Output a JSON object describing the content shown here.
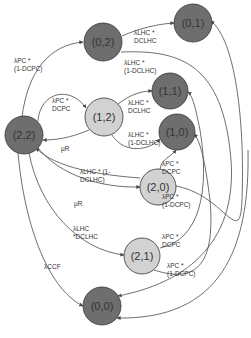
{
  "diagram": {
    "type": "state-transition-diagram",
    "colors": {
      "dark_node": "#6e6e6e",
      "light_node": "#d2d2d2",
      "edge": "#4a4a4a",
      "text": "#333333"
    },
    "nodes": [
      {
        "id": "n22",
        "label": "(2,2)",
        "shade": "dark"
      },
      {
        "id": "n02",
        "label": "(0,2)",
        "shade": "dark"
      },
      {
        "id": "n01",
        "label": "(0,1)",
        "shade": "dark"
      },
      {
        "id": "n12",
        "label": "(1,2)",
        "shade": "light"
      },
      {
        "id": "n11",
        "label": "(1,1)",
        "shade": "dark"
      },
      {
        "id": "n10",
        "label": "(1,0)",
        "shade": "dark"
      },
      {
        "id": "n20",
        "label": "(2,0)",
        "shade": "light"
      },
      {
        "id": "n21",
        "label": "(2,1)",
        "shade": "light"
      },
      {
        "id": "n00",
        "label": "(0,0)",
        "shade": "dark"
      }
    ],
    "edge_labels": {
      "e22_02": "λPC *\n(1-DCPC)",
      "e22_12": "λPC *\nDCPC",
      "e02_01": "λLHC *\nDCLHC",
      "e02_far": "λLHC *\n(1-DCLHC)",
      "e12_11": "λLHC *\nDCLHC",
      "e12_10": "λLHC *\n(1-DCLHC)",
      "e12_22": "μR",
      "e22_20": "λLHC * (1-\nDCLHC)",
      "e20_10": "λPC *\nDCPC",
      "e20_far": "λPC *\n(1-DCPC)",
      "e20_22": "μR",
      "e22_21": "λLHC\n*DCLHC",
      "e21_11": "λPC *\nDCPC",
      "e21_far": "λPC *\n(1-DCPC)",
      "e22_00": "λCCF"
    }
  }
}
